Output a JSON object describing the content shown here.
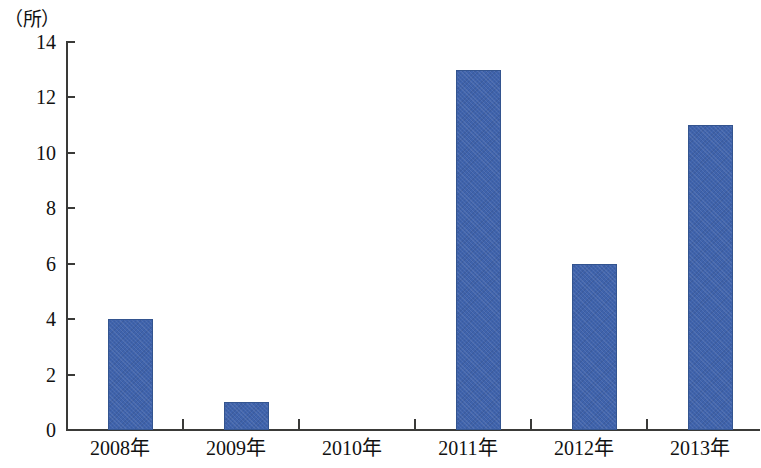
{
  "chart_data": {
    "type": "bar",
    "title": "",
    "subtitle": "",
    "xlabel": "",
    "ylabel": "（所）",
    "unit_label": "（所）",
    "categories": [
      "2008年",
      "2009年",
      "2010年",
      "2011年",
      "2012年",
      "2013年"
    ],
    "values": [
      4,
      1,
      0,
      13,
      6,
      11
    ],
    "series": [
      {
        "name": "",
        "values": [
          4,
          1,
          0,
          13,
          6,
          11
        ]
      }
    ],
    "ylim": [
      0,
      14
    ],
    "y_ticks": [
      0,
      2,
      4,
      6,
      8,
      10,
      12,
      14
    ],
    "y_tick_labels": [
      "0",
      "2",
      "4",
      "6",
      "8",
      "10",
      "12",
      "14"
    ],
    "grid": false,
    "legend": false,
    "legend_position": "none",
    "bar_color": "#3f63ac",
    "bar_border_color": "#33548f",
    "axis_color": "#3a3a38",
    "background_color": "#ffffff",
    "text_color": "#111111"
  }
}
